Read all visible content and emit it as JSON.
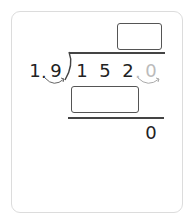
{
  "problem": {
    "divisor": {
      "digits": [
        "1",
        "9"
      ],
      "decimal_point": "."
    },
    "dividend": {
      "digits": [
        "1",
        "5",
        "2"
      ],
      "shifted_digit": "0"
    },
    "remainder": "0",
    "quotient_box": "",
    "product_box": ""
  },
  "colors": {
    "ink": "#222222",
    "ghost": "#bbbbbb",
    "border": "#dcdcdc"
  }
}
